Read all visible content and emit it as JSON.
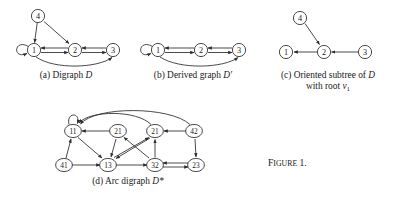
{
  "figure": {
    "number_label": "Figure 1.",
    "number_prefix": "F",
    "number_rest": "IGURE",
    "number_suffix": " 1."
  },
  "panels": [
    {
      "id": "a",
      "caption_parts": {
        "tag": "(a)",
        "text": "Digraph",
        "symbol": "D",
        "line2": ""
      },
      "nodes": [
        {
          "id": "n1",
          "label": "1",
          "x": 34,
          "y": 50
        },
        {
          "id": "n2",
          "label": "2",
          "x": 75,
          "y": 50
        },
        {
          "id": "n3",
          "label": "3",
          "x": 113,
          "y": 50
        },
        {
          "id": "n4",
          "label": "4",
          "x": 38,
          "y": 16
        }
      ],
      "edges": [
        {
          "from": "n1",
          "to": "n1",
          "kind": "loop"
        },
        {
          "from": "n2",
          "to": "n1",
          "kind": "straight"
        },
        {
          "from": "n3",
          "to": "n2",
          "kind": "straight"
        },
        {
          "from": "n4",
          "to": "n1",
          "kind": "straight"
        },
        {
          "from": "n4",
          "to": "n2",
          "kind": "straight"
        },
        {
          "from": "n1",
          "to": "n2",
          "kind": "straight-offset"
        },
        {
          "from": "n2",
          "to": "n3",
          "kind": "straight-offset"
        },
        {
          "from": "n1",
          "to": "n3",
          "kind": "arc-below"
        }
      ]
    },
    {
      "id": "b",
      "caption_parts": {
        "tag": "(b)",
        "text": "Derived graph",
        "symbol": "D′",
        "line2": ""
      },
      "nodes": [
        {
          "id": "m1",
          "label": "1",
          "x": 158,
          "y": 50
        },
        {
          "id": "m2",
          "label": "2",
          "x": 201,
          "y": 50
        },
        {
          "id": "m3",
          "label": "3",
          "x": 239,
          "y": 50
        }
      ],
      "edges": [
        {
          "from": "m1",
          "to": "m1",
          "kind": "loop"
        },
        {
          "from": "m2",
          "to": "m1",
          "kind": "straight"
        },
        {
          "from": "m1",
          "to": "m2",
          "kind": "straight-offset"
        },
        {
          "from": "m3",
          "to": "m2",
          "kind": "straight"
        },
        {
          "from": "m2",
          "to": "m3",
          "kind": "straight-offset"
        },
        {
          "from": "m1",
          "to": "m3",
          "kind": "arc-below"
        }
      ]
    },
    {
      "id": "c",
      "caption_parts": {
        "tag": "(c)",
        "text": "Oriented subtree of",
        "symbol": "D",
        "line2": "with root v₁",
        "line2_text": "with root ",
        "line2_sym": "v",
        "line2_sub": "1"
      },
      "nodes": [
        {
          "id": "p1",
          "label": "1",
          "x": 286,
          "y": 52
        },
        {
          "id": "p2",
          "label": "2",
          "x": 324,
          "y": 52
        },
        {
          "id": "p3",
          "label": "3",
          "x": 365,
          "y": 52
        },
        {
          "id": "p4",
          "label": "4",
          "x": 300,
          "y": 18
        }
      ],
      "edges": [
        {
          "from": "p2",
          "to": "p1",
          "kind": "straight"
        },
        {
          "from": "p3",
          "to": "p2",
          "kind": "straight"
        },
        {
          "from": "p4",
          "to": "p2",
          "kind": "straight"
        }
      ]
    },
    {
      "id": "d",
      "caption_parts": {
        "tag": "(d)",
        "text": "Arc digraph",
        "symbol": "D*",
        "line2": ""
      },
      "nodes": [
        {
          "id": "q11",
          "label": "11",
          "x": 73,
          "y": 131
        },
        {
          "id": "q21a",
          "label": "21",
          "x": 118,
          "y": 131
        },
        {
          "id": "q21b",
          "label": "21",
          "x": 155,
          "y": 131
        },
        {
          "id": "q42",
          "label": "42",
          "x": 194,
          "y": 131
        },
        {
          "id": "q41",
          "label": "41",
          "x": 64,
          "y": 165
        },
        {
          "id": "q13",
          "label": "13",
          "x": 108,
          "y": 165
        },
        {
          "id": "q32",
          "label": "32",
          "x": 155,
          "y": 165
        },
        {
          "id": "q23",
          "label": "23",
          "x": 196,
          "y": 165
        }
      ],
      "edges": [
        {
          "from": "q11",
          "to": "q11",
          "kind": "loop"
        },
        {
          "from": "q21a",
          "to": "q11",
          "kind": "straight"
        },
        {
          "from": "q42",
          "to": "q21b",
          "kind": "straight"
        },
        {
          "from": "q41",
          "to": "q11",
          "kind": "straight"
        },
        {
          "from": "q41",
          "to": "q13",
          "kind": "straight"
        },
        {
          "from": "q13",
          "to": "q32",
          "kind": "straight"
        },
        {
          "from": "q32",
          "to": "q23",
          "kind": "straight"
        },
        {
          "from": "q23",
          "to": "q32",
          "kind": "straight-offset"
        },
        {
          "from": "q21a",
          "to": "q13",
          "kind": "straight"
        },
        {
          "from": "q11",
          "to": "q13",
          "kind": "straight"
        },
        {
          "from": "q21b",
          "to": "q13",
          "kind": "straight"
        },
        {
          "from": "q13",
          "to": "q21b",
          "kind": "straight"
        },
        {
          "from": "q32",
          "to": "q21a",
          "kind": "straight"
        },
        {
          "from": "q32",
          "to": "q21b",
          "kind": "straight"
        },
        {
          "from": "q42",
          "to": "q23",
          "kind": "straight"
        },
        {
          "from": "q21b",
          "to": "q11",
          "kind": "arc-above"
        },
        {
          "from": "q42",
          "to": "q11",
          "kind": "arc-above-long"
        }
      ]
    }
  ]
}
